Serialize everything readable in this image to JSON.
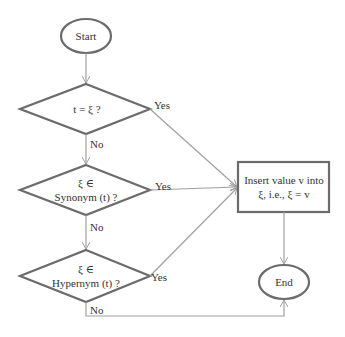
{
  "nodes": {
    "start": {
      "label": "Start"
    },
    "decision1": {
      "label": "t = ξ ?"
    },
    "decision2": {
      "line1": "ξ ∈",
      "line2": "Synonym (t) ?"
    },
    "decision3": {
      "line1": "ξ ∈",
      "line2": "Hypernym (t) ?"
    },
    "process": {
      "line1": "Insert value v into",
      "line2": "ξ, i.e., ξ = v"
    },
    "end": {
      "label": "End"
    }
  },
  "edges": {
    "d1_yes": "Yes",
    "d1_no": "No",
    "d2_yes": "Yes",
    "d2_no": "No",
    "d3_yes": "Yes",
    "d3_no": "No"
  },
  "colors": {
    "shape_stroke": "#6b6b6b",
    "arrow": "#a0a0a0",
    "text": "#333333"
  }
}
